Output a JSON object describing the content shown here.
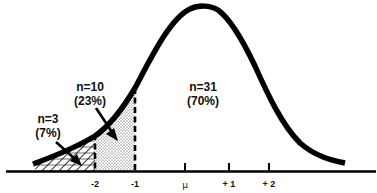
{
  "figure": {
    "axis": {
      "ticks": [
        {
          "label": "-2",
          "x": 95
        },
        {
          "label": "-1",
          "x": 135
        },
        {
          "label": "μ",
          "x": 185
        },
        {
          "label": "+ 1",
          "x": 229
        },
        {
          "label": "+ 2",
          "x": 269
        }
      ]
    },
    "regions": [
      {
        "id": "left-tail",
        "n_label": "n=3",
        "pct_label": "(7%)",
        "pattern": "hatched",
        "range": "below -2"
      },
      {
        "id": "middle-tail",
        "n_label": "n=10",
        "pct_label": "(23%)",
        "pattern": "stippled",
        "range": "-2 to -1"
      },
      {
        "id": "main",
        "n_label": "n=31",
        "pct_label": "(70%)",
        "pattern": "none",
        "range": "above -1"
      }
    ],
    "colors": {
      "curve": "#000000",
      "background": "#ffffff",
      "text": "#111111"
    }
  }
}
